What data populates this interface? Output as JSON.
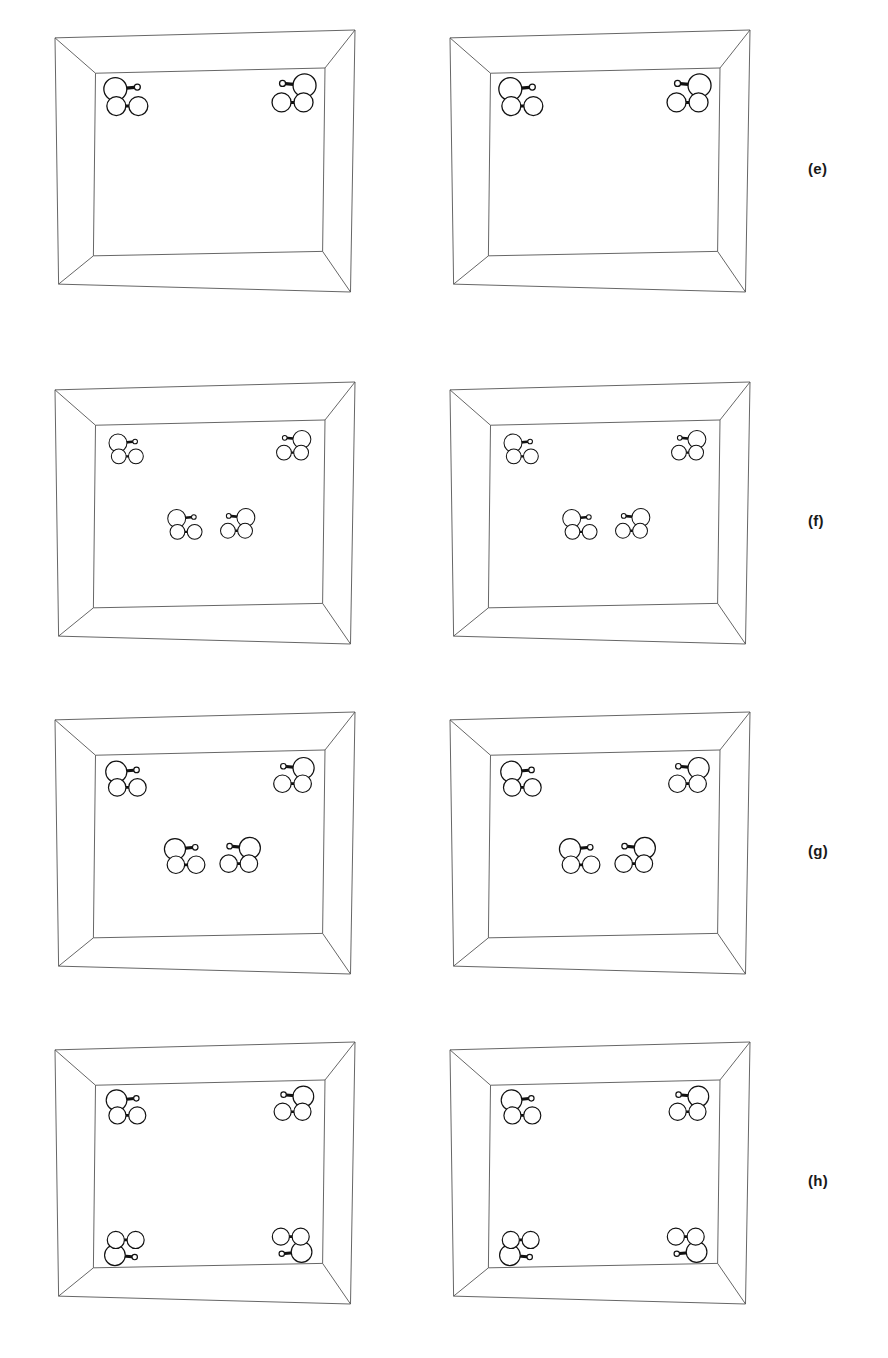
{
  "figure": {
    "type": "molecular-crystal-unit-cell-stereo-pairs",
    "background_color": "#ffffff",
    "line_color": "#555555",
    "atom_outline_color": "#111111",
    "atom_fill_color": "#ffffff",
    "bond_color": "#111111",
    "width": 888,
    "height": 1358
  },
  "panels": [
    {
      "id": "e",
      "label": "(e)",
      "label_x": 808,
      "label_y": 160,
      "row_top": 30,
      "box_width": 300,
      "box_height": 262,
      "left_box_x": 55,
      "right_box_x": 450,
      "molecule_count_per_box": 2,
      "molecule_scale": 1.0,
      "molecules": [
        {
          "x": 0.14,
          "y": 0.14,
          "mirror": false,
          "flip": false
        },
        {
          "x": 0.86,
          "y": 0.14,
          "mirror": true,
          "flip": false
        }
      ]
    },
    {
      "id": "f",
      "label": "(f)",
      "label_x": 808,
      "label_y": 512,
      "row_top": 382,
      "box_width": 300,
      "box_height": 262,
      "left_box_x": 55,
      "right_box_x": 450,
      "molecule_count_per_box": 4,
      "molecule_scale": 0.78,
      "molecules": [
        {
          "x": 0.14,
          "y": 0.14,
          "mirror": false,
          "flip": false
        },
        {
          "x": 0.86,
          "y": 0.14,
          "mirror": true,
          "flip": false
        },
        {
          "x": 0.4,
          "y": 0.56,
          "mirror": false,
          "flip": false
        },
        {
          "x": 0.62,
          "y": 0.56,
          "mirror": true,
          "flip": false
        }
      ]
    },
    {
      "id": "g",
      "label": "(g)",
      "label_x": 808,
      "label_y": 842,
      "row_top": 712,
      "box_width": 300,
      "box_height": 262,
      "left_box_x": 55,
      "right_box_x": 450,
      "molecule_count_per_box": 4,
      "molecule_scale": 0.92,
      "molecules": [
        {
          "x": 0.14,
          "y": 0.14,
          "mirror": false,
          "flip": false
        },
        {
          "x": 0.86,
          "y": 0.14,
          "mirror": true,
          "flip": false
        },
        {
          "x": 0.4,
          "y": 0.57,
          "mirror": false,
          "flip": false
        },
        {
          "x": 0.63,
          "y": 0.57,
          "mirror": true,
          "flip": false
        }
      ]
    },
    {
      "id": "h",
      "label": "(h)",
      "label_x": 808,
      "label_y": 1172,
      "row_top": 1042,
      "box_width": 300,
      "box_height": 262,
      "left_box_x": 55,
      "right_box_x": 450,
      "molecule_count_per_box": 4,
      "molecule_scale": 0.9,
      "molecules": [
        {
          "x": 0.14,
          "y": 0.13,
          "mirror": false,
          "flip": false
        },
        {
          "x": 0.86,
          "y": 0.13,
          "mirror": true,
          "flip": false
        },
        {
          "x": 0.14,
          "y": 0.89,
          "mirror": false,
          "flip": true
        },
        {
          "x": 0.86,
          "y": 0.89,
          "mirror": true,
          "flip": true
        }
      ]
    }
  ],
  "molecule": {
    "name": "three-atom-molecule",
    "atoms": [
      {
        "id": "A1",
        "role": "large-sphere",
        "r": 11.5,
        "dx": -12.0,
        "dy": -9.0
      },
      {
        "id": "A2",
        "role": "medium-sphere",
        "r": 9.5,
        "dx": -11.0,
        "dy": 8.0
      },
      {
        "id": "A3",
        "role": "medium-sphere",
        "r": 9.5,
        "dx": 11.0,
        "dy": 8.0
      },
      {
        "id": "A4",
        "role": "small-sphere",
        "r": 3.0,
        "dx": 10.0,
        "dy": -11.0
      }
    ],
    "bonds": [
      {
        "from": "A1",
        "to": "A4",
        "width": 3.4
      },
      {
        "from": "A1",
        "to": "A2",
        "width": 3.4
      },
      {
        "from": "A2",
        "to": "A3",
        "width": 3.0
      }
    ]
  },
  "cell_geometry": {
    "note": "Parallelepiped unit cell drawn in oblique projection",
    "outer": {
      "tl_x": 0.0,
      "tl_y": 0.03,
      "tr_x": 1.0,
      "tr_y": 0.0,
      "br_x": 0.985,
      "br_y": 1.0,
      "bl_x": 0.012,
      "bl_y": 0.97
    },
    "inner": {
      "tl_x": 0.135,
      "tl_y": 0.165,
      "tr_x": 0.9,
      "tr_y": 0.145,
      "br_x": 0.892,
      "br_y": 0.845,
      "bl_x": 0.128,
      "bl_y": 0.862
    }
  }
}
